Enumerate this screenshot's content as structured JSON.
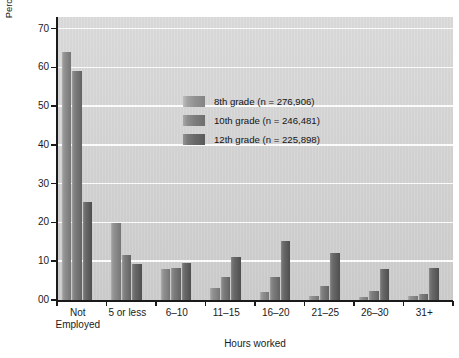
{
  "figure": {
    "scan_remnant": "",
    "background_color": "#ffffff",
    "plot_background_color": "#d6d6d6",
    "gridline_color": "#fbfbfb",
    "axis_color": "#1a1a1a"
  },
  "legend": {
    "position": "inside-top-left",
    "entries": [
      {
        "label": "8th grade (n = 276,906)",
        "swatch": "g8",
        "color": "#8e8e8e"
      },
      {
        "label": "10th grade (n = 246,481)",
        "swatch": "g10",
        "color": "#7b7b7b"
      },
      {
        "label": "12th grade (n = 225,898)",
        "swatch": "g12",
        "color": "#676767"
      }
    ]
  },
  "chart_data": {
    "type": "bar",
    "title": "",
    "xlabel": "Hours worked",
    "ylabel": "Percentage of employed students during the school year",
    "categories": [
      "Not\nEmployed",
      "5 or less",
      "6–10",
      "11–15",
      "16–20",
      "21–25",
      "26–30",
      "31+"
    ],
    "ylim": [
      0,
      73
    ],
    "yticks": [
      0,
      10,
      20,
      30,
      40,
      50,
      60,
      70
    ],
    "ytick_labels": [
      "00",
      "10",
      "20",
      "30",
      "40",
      "50",
      "60",
      "70"
    ],
    "grid": true,
    "series": [
      {
        "name": "8th grade (n = 276,906)",
        "color": "#8e8e8e",
        "values": [
          64.0,
          19.8,
          8.1,
          3.1,
          2.1,
          1.1,
          0.7,
          1.0
        ]
      },
      {
        "name": "10th grade (n = 246,481)",
        "color": "#7b7b7b",
        "values": [
          59.2,
          11.6,
          8.2,
          6.0,
          6.0,
          3.7,
          2.2,
          1.6
        ]
      },
      {
        "name": "12th grade (n = 225,898)",
        "color": "#676767",
        "values": [
          25.4,
          9.4,
          9.5,
          11.2,
          15.1,
          12.1,
          8.1,
          8.2
        ]
      }
    ]
  }
}
